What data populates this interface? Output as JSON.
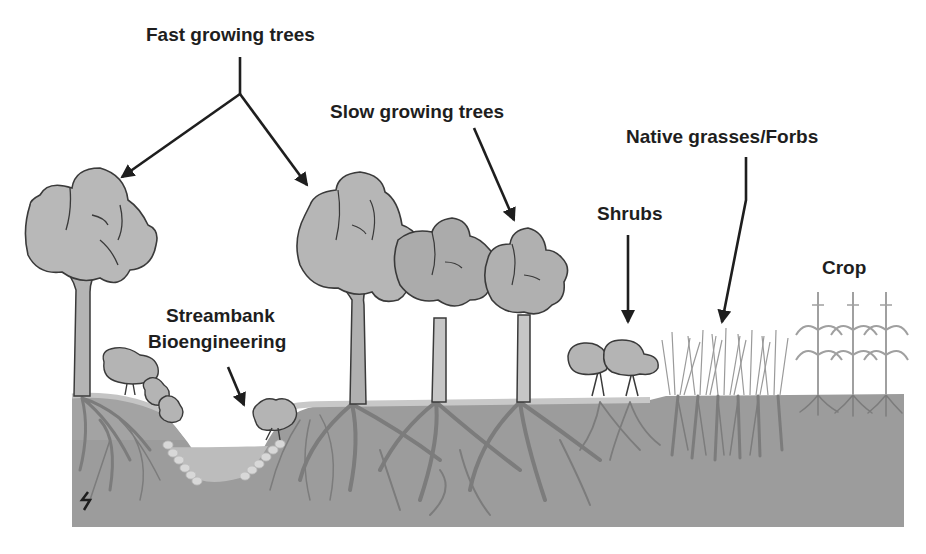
{
  "diagram": {
    "type": "riparian-buffer-cross-section",
    "labels": {
      "fast_trees": "Fast growing trees",
      "slow_trees": "Slow growing trees",
      "grasses": "Native grasses/Forbs",
      "shrubs": "Shrubs",
      "crop": "Crop",
      "streambank_line1": "Streambank",
      "streambank_line2": "Bioengineering"
    },
    "zones": [
      {
        "name": "Fast growing trees",
        "order": 1
      },
      {
        "name": "Streambank Bioengineering",
        "order": 2
      },
      {
        "name": "Slow growing trees",
        "order": 3
      },
      {
        "name": "Shrubs",
        "order": 4
      },
      {
        "name": "Native grasses/Forbs",
        "order": 5
      },
      {
        "name": "Crop",
        "order": 6
      }
    ],
    "colors": {
      "background": "#ffffff",
      "soil": "#9a9a9a",
      "soil_upper": "#a8a8a8",
      "stream": "#bdbdbd",
      "canopy": "#b8b8b8",
      "canopy_outline": "#3a3a3a",
      "roots": "#7a7a7a",
      "text": "#1e1e1e"
    }
  }
}
